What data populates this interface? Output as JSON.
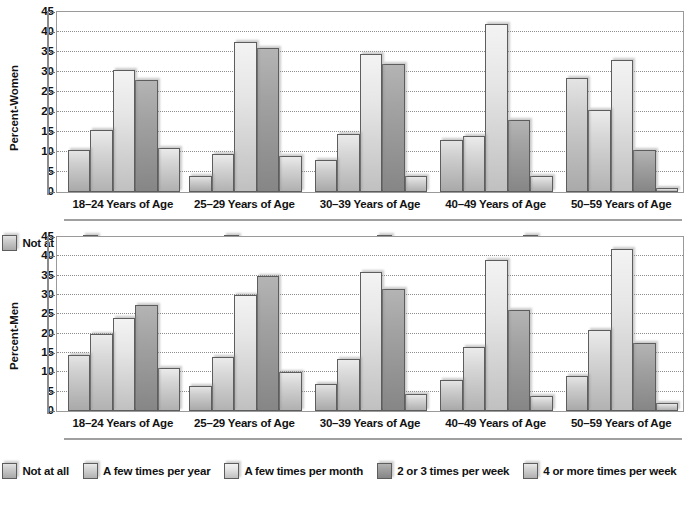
{
  "chart_data": [
    {
      "type": "bar",
      "title": "",
      "ylabel": "Percent-Women",
      "xlabel": "",
      "ylim": [
        0,
        45
      ],
      "yticks": [
        0,
        5,
        10,
        15,
        20,
        25,
        30,
        35,
        40,
        45
      ],
      "grid": true,
      "legend_position": "bottom",
      "categories": [
        "18–24 Years of Age",
        "25–29 Years of Age",
        "30–39 Years of Age",
        "40–49 Years of Age",
        "50–59 Years of Age"
      ],
      "series": [
        {
          "name": "Not at all",
          "values": [
            10.5,
            4.0,
            8.0,
            13.0,
            28.5
          ]
        },
        {
          "name": "A few times per year",
          "values": [
            15.5,
            9.5,
            14.5,
            14.0,
            20.5
          ]
        },
        {
          "name": "A few times per month",
          "values": [
            30.5,
            37.5,
            34.5,
            42.0,
            33.0
          ]
        },
        {
          "name": "2 or 3 times per week",
          "values": [
            28.0,
            36.0,
            32.0,
            18.0,
            10.5
          ]
        },
        {
          "name": "4 or more times per week",
          "values": [
            11.0,
            9.0,
            4.0,
            4.0,
            1.0
          ]
        }
      ]
    },
    {
      "type": "bar",
      "title": "",
      "ylabel": "Percent-Men",
      "xlabel": "",
      "ylim": [
        0,
        45
      ],
      "yticks": [
        0,
        5,
        10,
        15,
        20,
        25,
        30,
        35,
        40,
        45
      ],
      "grid": true,
      "legend_position": "bottom",
      "categories": [
        "18–24 Years of Age",
        "25–29 Years of Age",
        "30–39 Years of Age",
        "40–49 Years of Age",
        "50–59 Years of Age"
      ],
      "series": [
        {
          "name": "Not at all",
          "values": [
            14.5,
            6.5,
            7.0,
            8.0,
            9.0
          ]
        },
        {
          "name": "A few times per year",
          "values": [
            20.0,
            14.0,
            13.5,
            16.5,
            21.0
          ]
        },
        {
          "name": "A few times per month",
          "values": [
            24.0,
            30.0,
            36.0,
            39.0,
            42.0
          ]
        },
        {
          "name": "2 or 3 times per week",
          "values": [
            27.5,
            35.0,
            31.5,
            26.0,
            17.5
          ]
        },
        {
          "name": "4 or more times per week",
          "values": [
            11.0,
            10.0,
            4.5,
            4.0,
            2.0
          ]
        }
      ]
    }
  ],
  "series_colors": [
    "#cfcfcf",
    "#d8d8d8",
    "#e6e6e6",
    "#a2a2a2",
    "#d6d6d6"
  ]
}
